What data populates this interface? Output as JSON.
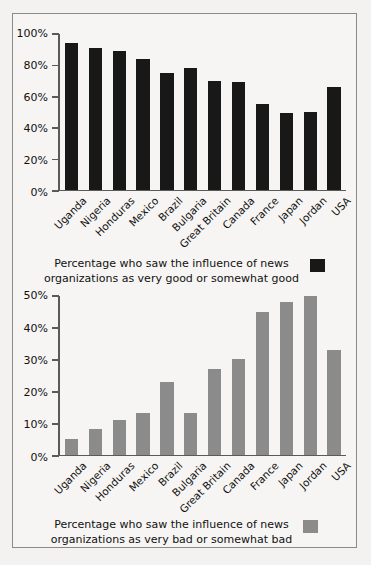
{
  "chart_data": [
    {
      "type": "bar",
      "id": "good",
      "title": "",
      "xlabel": "",
      "ylabel": "",
      "ylim": [
        0,
        100
      ],
      "ytick_labels": [
        "0%",
        "20%",
        "40%",
        "60%",
        "80%",
        "100%"
      ],
      "ytick_values": [
        0,
        20,
        40,
        60,
        80,
        100
      ],
      "grid": false,
      "bar_color": "#181818",
      "legend_position": "below",
      "legend_line1": "Percentage who saw the influence of news",
      "legend_line2": "organizations as very good or somewhat good",
      "categories": [
        "Uganda",
        "Nigeria",
        "Honduras",
        "Mexico",
        "Brazil",
        "Bulgaria",
        "Great Britain",
        "Canada",
        "France",
        "Japan",
        "Jordan",
        "USA"
      ],
      "values": [
        94,
        91,
        89,
        84,
        75,
        78,
        70,
        69,
        55,
        49,
        50,
        66
      ]
    },
    {
      "type": "bar",
      "id": "bad",
      "title": "",
      "xlabel": "",
      "ylabel": "",
      "ylim": [
        0,
        50
      ],
      "ytick_labels": [
        "0%",
        "10%",
        "20%",
        "30%",
        "40%",
        "50%"
      ],
      "ytick_values": [
        0,
        10,
        20,
        30,
        40,
        50
      ],
      "grid": false,
      "bar_color": "#8b8b8b",
      "legend_position": "below",
      "legend_line1": "Percentage who saw the influence of news",
      "legend_line2": "organizations as very bad or somewhat bad",
      "categories": [
        "Uganda",
        "Nigeria",
        "Honduras",
        "Mexico",
        "Brazil",
        "Bulgaria",
        "Great Britain",
        "Canada",
        "France",
        "Japan",
        "Jordan",
        "USA"
      ],
      "values": [
        5,
        8,
        11,
        13,
        23,
        13,
        27,
        30,
        45,
        48,
        50,
        33
      ]
    }
  ]
}
